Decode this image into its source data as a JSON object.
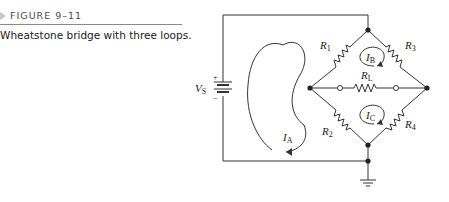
{
  "figure": {
    "number": "FIGURE 9–11",
    "caption": "Wheatstone bridge with three loops."
  },
  "circuit": {
    "source": {
      "label": "V",
      "subscript": "S",
      "plus": "+",
      "minus": "−"
    },
    "resistors": [
      {
        "id": "R1",
        "label": "R",
        "subscript": "1"
      },
      {
        "id": "R2",
        "label": "R",
        "subscript": "2"
      },
      {
        "id": "R3",
        "label": "R",
        "subscript": "3"
      },
      {
        "id": "R4",
        "label": "R",
        "subscript": "4"
      },
      {
        "id": "RL",
        "label": "R",
        "subscript": "L"
      }
    ],
    "loop_currents": [
      {
        "id": "IA",
        "label": "I",
        "subscript": "A"
      },
      {
        "id": "IB",
        "label": "I",
        "subscript": "B"
      },
      {
        "id": "IC",
        "label": "I",
        "subscript": "C"
      }
    ],
    "ground": "ground-symbol"
  }
}
